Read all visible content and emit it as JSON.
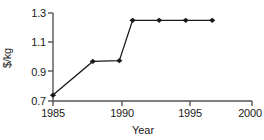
{
  "chart_data": {
    "type": "line",
    "title": "",
    "xlabel": "Year",
    "ylabel": "$/kg",
    "xlim": [
      1984,
      2000
    ],
    "ylim": [
      0.7,
      1.3
    ],
    "xticks": [
      1985,
      1990,
      1995,
      2000
    ],
    "xtick_labels": [
      "1985",
      "1990",
      "1995",
      "2000"
    ],
    "yticks": [
      0.7,
      0.9,
      1.1,
      1.3
    ],
    "ytick_labels": [
      "0.7",
      "0.9",
      "1.1",
      "1.3"
    ],
    "grid": false,
    "legend": null,
    "series": [
      {
        "name": "price",
        "marker": "diamond",
        "color": "#1a1a1a",
        "x": [
          1985,
          1988,
          1990,
          1991,
          1993,
          1995,
          1997
        ],
        "values": [
          0.74,
          0.97,
          0.975,
          1.25,
          1.25,
          1.25,
          1.25
        ]
      }
    ]
  },
  "axes": {
    "y_tick_0": "0.7",
    "y_tick_1": "0.9",
    "y_tick_2": "1.1",
    "y_tick_3": "1.3",
    "x_tick_0": "1985",
    "x_tick_1": "1990",
    "x_tick_2": "1995",
    "x_tick_3": "2000",
    "x_axis_title": "Year",
    "y_axis_title": "$/kg"
  },
  "colors": {
    "line": "#1a1a1a",
    "marker": "#111111",
    "axis": "#555555",
    "background": "#ffffff"
  }
}
